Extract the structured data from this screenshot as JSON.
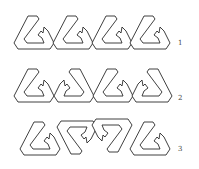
{
  "figure": {
    "rows": [
      {
        "label": "1",
        "shapes": [
          {
            "transform": "none"
          },
          {
            "transform": "none"
          },
          {
            "transform": "none"
          },
          {
            "transform": "none"
          }
        ]
      },
      {
        "label": "2",
        "shapes": [
          {
            "transform": "none"
          },
          {
            "transform": "mirror-x"
          },
          {
            "transform": "none"
          },
          {
            "transform": "mirror-x"
          }
        ]
      },
      {
        "label": "3",
        "shapes": [
          {
            "transform": "none"
          },
          {
            "transform": "mirror-y"
          },
          {
            "transform": "rotate-180"
          },
          {
            "transform": "none"
          }
        ]
      }
    ],
    "colors": {
      "stroke": "#2a2a2a",
      "fill": "#ffffff",
      "label": "#444444"
    }
  }
}
